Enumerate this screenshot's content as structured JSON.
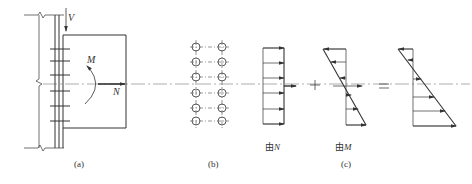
{
  "figure": {
    "panels": {
      "a": {
        "label": "(a)",
        "forces": {
          "shear": "V",
          "moment": "M",
          "axial": "N"
        }
      },
      "b": {
        "label": "(b)",
        "bolt_rows": 6,
        "bolt_columns": 2
      },
      "c": {
        "label": "(c)"
      }
    },
    "stress_diagrams": {
      "due_to_n": {
        "prefix": "由",
        "symbol": "N"
      },
      "due_to_m": {
        "prefix": "由",
        "symbol": "M"
      }
    },
    "operators": {
      "plus": "+",
      "equals": "="
    }
  },
  "colors": {
    "line": "#333333",
    "centerline": "#555555",
    "background": "#ffffff"
  }
}
